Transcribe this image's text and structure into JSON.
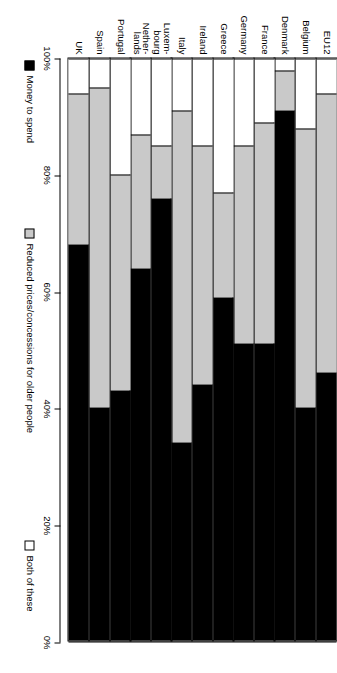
{
  "chart_data": {
    "type": "bar",
    "subtype": "stacked-horizontal-100pct",
    "title": "",
    "xlabel": "",
    "ylabel": "",
    "orientation": "rotated-90",
    "xlim": [
      0,
      100
    ],
    "grid": false,
    "legend_position": "right-of-plot",
    "tick_labels": [
      "0%",
      "20%",
      "40%",
      "60%",
      "80%",
      "100%"
    ],
    "tick_values": [
      0,
      20,
      40,
      60,
      80,
      100
    ],
    "categories": [
      "EU12",
      "Belgium",
      "Denmark",
      "France",
      "Germany",
      "Greece",
      "Ireland",
      "Italy",
      "Luxem-\nbourg",
      "Nether-\nlands",
      "Portugal",
      "Spain",
      "UK"
    ],
    "series": [
      {
        "name": "Money to spend",
        "color": "#000000",
        "values": [
          46,
          40,
          91,
          51,
          51,
          59,
          44,
          34,
          76,
          64,
          43,
          40,
          68
        ]
      },
      {
        "name": "Reduced prices/concessions for older people",
        "color": "#c9c9c9",
        "values": [
          48,
          48,
          7,
          38,
          34,
          18,
          41,
          57,
          9,
          23,
          37,
          55,
          26
        ]
      },
      {
        "name": "Both of these",
        "color": "#ffffff",
        "values": [
          6,
          12,
          2,
          11,
          15,
          23,
          15,
          9,
          15,
          13,
          20,
          5,
          6
        ]
      }
    ]
  },
  "legend": {
    "items": [
      {
        "label": "Money to spend",
        "swatch": "money"
      },
      {
        "label": "Reduced prices/concessions for older people",
        "swatch": "reduced"
      },
      {
        "label": "Both of these",
        "swatch": "both"
      }
    ]
  }
}
